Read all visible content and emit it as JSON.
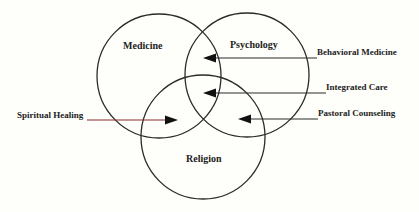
{
  "diagram": {
    "type": "venn",
    "circles": [
      {
        "id": "medicine",
        "label": "Medicine",
        "cx": 159,
        "cy": 76,
        "r": 62
      },
      {
        "id": "psychology",
        "label": "Psychology",
        "cx": 247,
        "cy": 75,
        "r": 62
      },
      {
        "id": "religion",
        "label": "Religion",
        "cx": 203,
        "cy": 137,
        "r": 62
      }
    ],
    "arrows": [
      {
        "id": "behavioral-medicine",
        "label": "Behavioral Medicine",
        "points_to": "Medicine ∩ Psychology"
      },
      {
        "id": "integrated-care",
        "label": "Integrated Care",
        "points_to": "Medicine ∩ Psychology ∩ Religion"
      },
      {
        "id": "pastoral-counseling",
        "label": "Pastoral Counseling",
        "points_to": "Psychology ∩ Religion"
      },
      {
        "id": "spiritual-healing",
        "label": "Spiritual Healing",
        "points_to": "Medicine ∩ Religion"
      }
    ],
    "colors": {
      "background": "#fefefa",
      "stroke": "#2a2a2a",
      "spiritual_line": "#8b2a2a"
    }
  }
}
